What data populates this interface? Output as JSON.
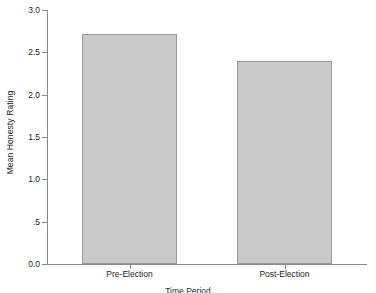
{
  "chart_data": {
    "type": "bar",
    "title": "",
    "categories": [
      "Pre-Election",
      "Post-Election"
    ],
    "values": [
      2.72,
      2.4
    ],
    "xlabel": "Time Period",
    "ylabel": "Mean Honesty Rating",
    "ylim": [
      0.0,
      3.0
    ],
    "yticks": [
      0.0,
      0.5,
      1.0,
      1.5,
      2.0,
      2.5,
      3.0
    ],
    "ytick_labels": [
      "0.0",
      ".5",
      "1.0",
      "1.5",
      "2.0",
      "2.5",
      "3.0"
    ],
    "grid": false,
    "legend": null,
    "bar_fill_color": "#c9c9c9",
    "bar_border_color": "#9a9a9a",
    "axis_color": "#8a8a8a",
    "background_color": "#ffffff"
  }
}
